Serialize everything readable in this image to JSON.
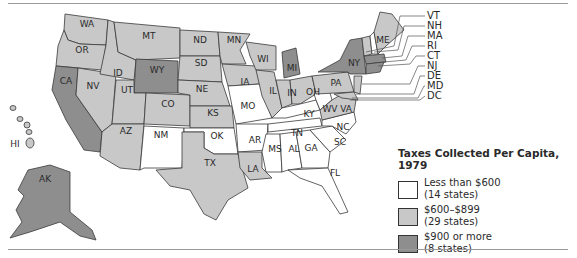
{
  "map": {
    "title": "Taxes Collected Per Capita, 1979",
    "colors": {
      "low": "#ffffff",
      "mid": "#c8c8c8",
      "high": "#8e8e8e",
      "border": "#3a3a3a"
    },
    "legend": [
      {
        "label": "Less than $600",
        "count": "(14 states)",
        "class": "low"
      },
      {
        "label": "$600–$899",
        "count": "(29 states)",
        "class": "mid"
      },
      {
        "label": "$900 or more",
        "count": "(8 states)",
        "class": "high"
      }
    ],
    "state_labels": {
      "WA": "WA",
      "OR": "OR",
      "CA": "CA",
      "ID": "ID",
      "NV": "NV",
      "MT": "MT",
      "WY": "WY",
      "UT": "UT",
      "CO": "CO",
      "AZ": "AZ",
      "NM": "NM",
      "ND": "ND",
      "SD": "SD",
      "NE": "NE",
      "KS": "KS",
      "OK": "OK",
      "TX": "TX",
      "MN": "MN",
      "IA": "IA",
      "MO": "MO",
      "AR": "AR",
      "LA": "LA",
      "WI": "WI",
      "IL": "IL",
      "MI": "MI",
      "IN": "IN",
      "OH": "OH",
      "KY": "KY",
      "TN": "TN",
      "MS": "MS",
      "AL": "AL",
      "GA": "GA",
      "FL": "FL",
      "SC": "SC",
      "NC": "NC",
      "VA": "VA",
      "WV": "WV",
      "PA": "PA",
      "NY": "NY",
      "ME": "ME",
      "HI": "HI",
      "AK": "AK"
    },
    "northeast_callouts": [
      "VT",
      "NH",
      "MA",
      "RI",
      "CT",
      "NJ",
      "DE",
      "MD",
      "DC"
    ],
    "states": {
      "low": [
        "NM",
        "OK",
        "MO",
        "AR",
        "KY",
        "WV",
        "TN",
        "MS",
        "AL",
        "GA",
        "SC",
        "NC",
        "FL",
        "NH"
      ],
      "mid": [
        "WA",
        "OR",
        "ID",
        "MT",
        "NV",
        "UT",
        "AZ",
        "CO",
        "ND",
        "SD",
        "NE",
        "KS",
        "TX",
        "MN",
        "IA",
        "WI",
        "IL",
        "IN",
        "OH",
        "LA",
        "PA",
        "VA",
        "ME",
        "VT",
        "NJ",
        "DE",
        "MD",
        "DC",
        "HI"
      ],
      "high": [
        "CA",
        "WY",
        "AK",
        "MI",
        "NY",
        "MA",
        "RI",
        "CT"
      ]
    }
  }
}
